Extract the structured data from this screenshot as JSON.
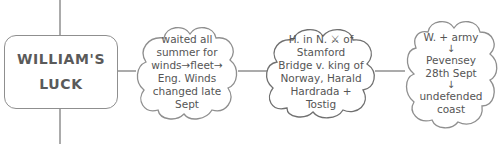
{
  "title": {
    "line1": "WILLIAM'S",
    "line2": "LUCK"
  },
  "clouds": [
    {
      "lines": [
        "waited all",
        "summer for",
        "winds→fleet→",
        "Eng. Winds",
        "changed late",
        "Sept"
      ]
    },
    {
      "lines": [
        "H. in N. ⚔ of",
        "Stamford",
        "Bridge v. king of",
        "Norway, Harald",
        "Hardrada +",
        "Tostig"
      ]
    },
    {
      "lines": [
        "W. + army",
        "↓",
        "Pevensey",
        "28th Sept",
        "↓",
        "undefended",
        "coast"
      ]
    }
  ],
  "colors": {
    "stroke": "#8f8f8f",
    "text": "#555555",
    "background": "#ffffff"
  }
}
